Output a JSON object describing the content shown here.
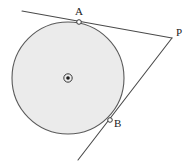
{
  "figure": {
    "width": 195,
    "height": 165,
    "background_color": "#ffffff"
  },
  "labels": {
    "point_a": "A",
    "point_b": "B",
    "point_p": "P"
  },
  "colors": {
    "circle_fill": "#ebebeb",
    "circle_stroke": "#5a5a5a",
    "line_stroke": "#4a4a4a",
    "marker_stroke": "#3a3a3a",
    "marker_fill": "#ffffff",
    "center_dot": "#1b1b1b",
    "label_color": "#1b1b1b"
  },
  "chart_data": {
    "type": "scatter",
    "xlabel": "",
    "ylabel": "",
    "xlim": [
      0,
      195
    ],
    "ylim": [
      0,
      165
    ],
    "grid": false,
    "legend": "none",
    "circle": {
      "center": [
        68,
        78
      ],
      "radius": 56,
      "fill": "#ebebeb",
      "stroke": "#5a5a5a",
      "center_marker": "circled-dot"
    },
    "points": [
      {
        "name": "A",
        "x": 79,
        "y": 22,
        "role": "tangent-point",
        "label_offset": [
          -1,
          -10
        ]
      },
      {
        "name": "B",
        "x": 110,
        "y": 120,
        "role": "tangent-point",
        "label_offset": [
          7,
          4
        ]
      },
      {
        "name": "P",
        "x": 172,
        "y": 38,
        "role": "external-point",
        "label_offset": [
          7,
          -5
        ]
      },
      {
        "name": "O",
        "x": 68,
        "y": 78,
        "role": "center",
        "label_offset": [
          0,
          0
        ]
      }
    ],
    "segments": [
      {
        "name": "tangent-line-a",
        "from": [
          22,
          11
        ],
        "to": [
          172,
          38
        ],
        "through": "A"
      },
      {
        "name": "tangent-line-b",
        "from": [
          172,
          38
        ],
        "to": [
          78,
          160
        ],
        "through": "B"
      }
    ],
    "annotations": [
      "Line through A is tangent to the circle at A and passes through P",
      "Line through B is tangent to the circle at B and passes through P",
      "O is the center of the circle"
    ]
  }
}
